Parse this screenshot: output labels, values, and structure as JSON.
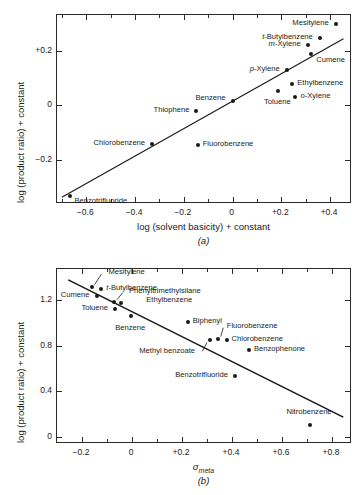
{
  "figures": [
    {
      "id": "a",
      "caption": "(a)",
      "chart_data": {
        "type": "scatter",
        "title": "",
        "xlabel": "log (solvent basicity)  + constant",
        "ylabel": "log (product ratio) + constant",
        "xlim": [
          -0.72,
          0.49
        ],
        "ylim": [
          -0.36,
          0.33
        ],
        "xticks": [
          -0.6,
          -0.4,
          -0.2,
          0,
          0.2,
          0.4
        ],
        "xticklabels": [
          "−0.6",
          "−0.4",
          "−0.2",
          "0",
          "+0.2",
          "+0.4"
        ],
        "yticks": [
          0.2,
          0,
          -0.2
        ],
        "yticklabels": [
          "+0.2",
          "0",
          "−0.2"
        ],
        "grid": false,
        "legend": "none",
        "fit_line": {
          "x0": -0.7,
          "y0": -0.335,
          "x1": 0.455,
          "y1": 0.243
        },
        "points": [
          {
            "label": "Benzotrifluoride",
            "x": -0.665,
            "y": -0.33,
            "anchor": "start",
            "dx": 5,
            "dy": 6
          },
          {
            "label": "Chlorobenzene",
            "x": -0.33,
            "y": -0.142,
            "anchor": "end",
            "dx": -6,
            "dy": 0
          },
          {
            "label": "Fluorobenzene",
            "x": -0.143,
            "y": -0.145,
            "anchor": "start",
            "dx": 6,
            "dy": 0
          },
          {
            "label": "Thiophene",
            "x": -0.148,
            "y": -0.02,
            "anchor": "end",
            "dx": -6,
            "dy": 0
          },
          {
            "label": "Benzene",
            "x": 0.0,
            "y": 0.016,
            "anchor": "end",
            "dx": -6,
            "dy": -2
          },
          {
            "label": "Toluene",
            "x": 0.188,
            "y": 0.052,
            "anchor": "mid",
            "dx": 0,
            "dy": 12
          },
          {
            "label": "o-Xylene",
            "x": 0.258,
            "y": 0.03,
            "anchor": "start",
            "dx": 6,
            "dy": 0,
            "italic_prefix": "o"
          },
          {
            "label": "Ethylbenzene",
            "x": 0.245,
            "y": 0.078,
            "anchor": "start",
            "dx": 6,
            "dy": 0
          },
          {
            "label": "p-Xylene",
            "x": 0.222,
            "y": 0.13,
            "anchor": "end",
            "dx": -6,
            "dy": 0,
            "italic_prefix": "p"
          },
          {
            "label": "Cumene",
            "x": 0.323,
            "y": 0.188,
            "anchor": "start",
            "dx": 6,
            "dy": 7
          },
          {
            "label": "m-Xylene",
            "x": 0.308,
            "y": 0.222,
            "anchor": "end",
            "dx": -6,
            "dy": 0,
            "italic_prefix": "m"
          },
          {
            "label": "t-Butylbenzene",
            "x": 0.358,
            "y": 0.246,
            "anchor": "end",
            "dx": -6,
            "dy": 0,
            "italic_prefix": "t"
          },
          {
            "label": "Mesitylene",
            "x": 0.423,
            "y": 0.296,
            "anchor": "end",
            "dx": -6,
            "dy": 0
          }
        ]
      }
    },
    {
      "id": "b",
      "caption": "(b)",
      "chart_data": {
        "type": "scatter",
        "title": "",
        "xlabel": "σmeta",
        "xlabel_base": "σ",
        "xlabel_sub": "meta",
        "ylabel": "log (product ratio) + constant",
        "xlim": [
          -0.3,
          0.88
        ],
        "ylim": [
          -0.06,
          1.47
        ],
        "xticks": [
          -0.2,
          0,
          0.2,
          0.4,
          0.6,
          0.8
        ],
        "xticklabels": [
          "−0.2",
          "0",
          "+0.2",
          "+0.4",
          "+0.6",
          "+0.8"
        ],
        "yticks": [
          1.2,
          0.8,
          0.4,
          0
        ],
        "yticklabels": [
          "1.2",
          "0.8",
          "0.4",
          "0"
        ],
        "grid": false,
        "legend": "none",
        "fit_line": {
          "x0": -0.255,
          "y0": 1.375,
          "x1": 0.845,
          "y1": 0.175
        },
        "points": [
          {
            "label": "Mesitylene",
            "x": -0.162,
            "y": 1.315,
            "anchor": "start",
            "dx": 18,
            "dy": -14,
            "leader": true
          },
          {
            "label": "t-Butylbenzene",
            "x": -0.123,
            "y": 1.293,
            "anchor": "start",
            "dx": 6,
            "dy": 0,
            "italic_prefix": "t"
          },
          {
            "label": "Cumene",
            "x": -0.142,
            "y": 1.233,
            "anchor": "end",
            "dx": -6,
            "dy": 0
          },
          {
            "label": "Phenyltrimethylsilane",
            "x": -0.072,
            "y": 1.185,
            "anchor": "start",
            "dx": 16,
            "dy": -10,
            "leader": true
          },
          {
            "label": "Ethylbenzene",
            "x": -0.043,
            "y": 1.172,
            "anchor": "start",
            "dx": 26,
            "dy": -2
          },
          {
            "label": "Toluene",
            "x": -0.068,
            "y": 1.118,
            "anchor": "end",
            "dx": -6,
            "dy": 0
          },
          {
            "label": "Benzene",
            "x": -0.003,
            "y": 1.06,
            "anchor": "mid",
            "dx": 0,
            "dy": 13
          },
          {
            "label": "Biphenyl",
            "x": 0.223,
            "y": 1.005,
            "anchor": "start",
            "dx": 6,
            "dy": 0
          },
          {
            "label": "Methyl benzoate",
            "x": 0.312,
            "y": 0.845,
            "anchor": "end",
            "dx": -14,
            "dy": 12,
            "leader": true
          },
          {
            "label": "Fluorobenzene",
            "x": 0.343,
            "y": 0.862,
            "anchor": "start",
            "dx": 10,
            "dy": -12,
            "leader": true
          },
          {
            "label": "Chlorobenzene",
            "x": 0.378,
            "y": 0.845,
            "anchor": "start",
            "dx": 6,
            "dy": 0
          },
          {
            "label": "Benzophenone",
            "x": 0.468,
            "y": 0.765,
            "anchor": "start",
            "dx": 6,
            "dy": 0
          },
          {
            "label": "Benzotrifluoride",
            "x": 0.412,
            "y": 0.535,
            "anchor": "end",
            "dx": -6,
            "dy": 0
          },
          {
            "label": "Nitrobenzene",
            "x": 0.712,
            "y": 0.11,
            "anchor": "mid",
            "dx": 0,
            "dy": -12
          }
        ]
      }
    }
  ]
}
